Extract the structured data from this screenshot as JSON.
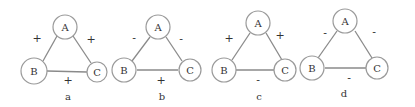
{
  "panels": [
    {
      "caption": "a",
      "nodes": {
        "A": "A",
        "B": "B",
        "C": "C"
      },
      "edges": {
        "AB": "+",
        "AC": "+",
        "BC": "+"
      }
    },
    {
      "caption": "b",
      "nodes": {
        "A": "A",
        "B": "B",
        "C": "C"
      },
      "edges": {
        "AB": "-",
        "AC": "-",
        "BC": "+"
      }
    },
    {
      "caption": "c",
      "nodes": {
        "A": "A",
        "B": "B",
        "C": "C"
      },
      "edges": {
        "AB": "+",
        "AC": "+",
        "BC": "-"
      }
    },
    {
      "caption": "d",
      "nodes": {
        "A": "A",
        "B": "B",
        "C": "C"
      },
      "edges": {
        "AB": "-",
        "AC": "-",
        "BC": "-"
      }
    }
  ],
  "colors": {
    "node_stroke": "#9a9a9a",
    "edge": "#8a8a8a",
    "text": "#333333",
    "background": "#ffffff"
  }
}
